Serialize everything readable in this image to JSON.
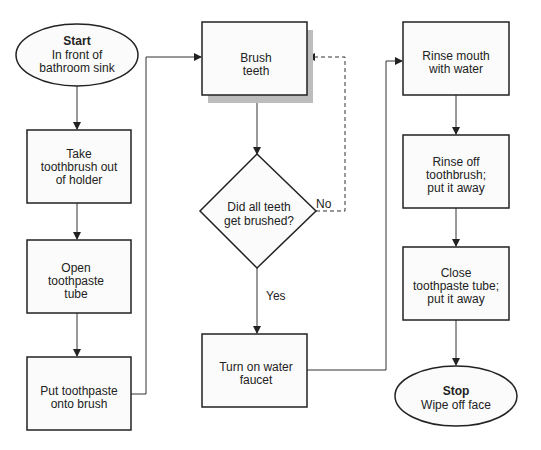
{
  "diagram": {
    "type": "flowchart",
    "colors": {
      "stroke": "#222222",
      "fill": "#fbfbfb",
      "shadow": "#bdbdbd"
    },
    "nodes": {
      "start": {
        "shape": "ellipse",
        "title": "Start",
        "lines": [
          "In front of",
          "bathroom sink"
        ]
      },
      "take": {
        "shape": "rect",
        "lines": [
          "Take",
          "toothbrush out",
          "of holder"
        ]
      },
      "open": {
        "shape": "rect",
        "lines": [
          "Open",
          "toothpaste",
          "tube"
        ]
      },
      "put": {
        "shape": "rect",
        "lines": [
          "Put toothpaste",
          "onto brush"
        ]
      },
      "brush": {
        "shape": "rect",
        "shadow": true,
        "lines": [
          "Brush",
          "teeth"
        ]
      },
      "decision": {
        "shape": "diamond",
        "lines": [
          "Did all teeth",
          "get brushed?"
        ]
      },
      "faucet": {
        "shape": "rect",
        "lines": [
          "Turn on water",
          "faucet"
        ]
      },
      "rinse_mouth": {
        "shape": "rect",
        "lines": [
          "Rinse mouth",
          "with water"
        ]
      },
      "rinse_brush": {
        "shape": "rect",
        "lines": [
          "Rinse off",
          "toothbrush;",
          "put it away"
        ]
      },
      "close": {
        "shape": "rect",
        "lines": [
          "Close",
          "toothpaste tube;",
          "put it away"
        ]
      },
      "stop": {
        "shape": "ellipse",
        "title": "Stop",
        "lines": [
          "Wipe off face"
        ]
      }
    },
    "edges": [
      {
        "from": "start",
        "to": "take"
      },
      {
        "from": "take",
        "to": "open"
      },
      {
        "from": "open",
        "to": "put"
      },
      {
        "from": "put",
        "to": "brush"
      },
      {
        "from": "brush",
        "to": "decision"
      },
      {
        "from": "decision",
        "to": "brush",
        "label": "No",
        "style": "dashed"
      },
      {
        "from": "decision",
        "to": "faucet",
        "label": "Yes"
      },
      {
        "from": "faucet",
        "to": "rinse_mouth"
      },
      {
        "from": "rinse_mouth",
        "to": "rinse_brush"
      },
      {
        "from": "rinse_brush",
        "to": "close"
      },
      {
        "from": "close",
        "to": "stop"
      }
    ],
    "labels": {
      "no": "No",
      "yes": "Yes"
    }
  }
}
